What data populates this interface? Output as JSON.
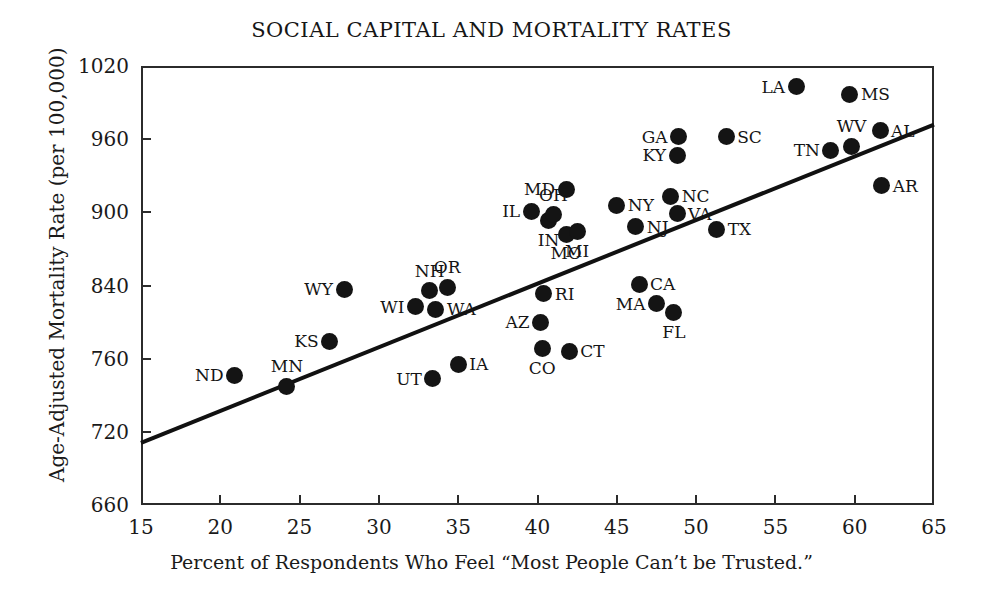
{
  "chart_data": {
    "type": "scatter",
    "title": "SOCIAL CAPITAL AND MORTALITY RATES",
    "xlabel": "Percent of Respondents Who Feel “Most People Can’t be Trusted.”",
    "ylabel": "Age-Adjusted Mortality Rate (per 100,000)",
    "xlim": [
      15,
      65
    ],
    "ylim": [
      660,
      1020
    ],
    "grid": false,
    "legend": null,
    "xticks": [
      15,
      20,
      25,
      30,
      35,
      40,
      45,
      50,
      55,
      60,
      65
    ],
    "xtick_labels": [
      "15",
      "20",
      "25",
      "30",
      "35",
      "40",
      "45",
      "50",
      "55",
      "60",
      "65"
    ],
    "yticks": [
      660,
      720,
      760,
      840,
      900,
      960,
      1020
    ],
    "ytick_labels": [
      "660",
      "720",
      "760",
      "840",
      "900",
      "960",
      "1020"
    ],
    "point_labels_field": "label",
    "trendline": {
      "type": "linear",
      "x_start": 15,
      "y_start": 711,
      "x_end": 65,
      "y_end": 972
    },
    "points": [
      {
        "label": "ND",
        "x": 20.9,
        "y": 751,
        "label_pos": "left"
      },
      {
        "label": "MN",
        "x": 24.2,
        "y": 745,
        "label_pos": "above"
      },
      {
        "label": "KS",
        "x": 26.9,
        "y": 779,
        "label_pos": "left"
      },
      {
        "label": "WY",
        "x": 27.8,
        "y": 836,
        "label_pos": "left"
      },
      {
        "label": "WI",
        "x": 32.3,
        "y": 817,
        "label_pos": "left"
      },
      {
        "label": "NH",
        "x": 33.2,
        "y": 834,
        "label_pos": "above"
      },
      {
        "label": "WA",
        "x": 33.6,
        "y": 814,
        "label_pos": "right"
      },
      {
        "label": "OR",
        "x": 34.3,
        "y": 838,
        "label_pos": "above"
      },
      {
        "label": "UT",
        "x": 33.4,
        "y": 749,
        "label_pos": "left"
      },
      {
        "label": "IA",
        "x": 35.0,
        "y": 757,
        "label_pos": "right"
      },
      {
        "label": "IL",
        "x": 39.6,
        "y": 901,
        "label_pos": "left"
      },
      {
        "label": "IN",
        "x": 40.7,
        "y": 893,
        "label_pos": "below"
      },
      {
        "label": "MD",
        "x": 41.8,
        "y": 919,
        "label_pos": "left"
      },
      {
        "label": "OH",
        "x": 41.0,
        "y": 898,
        "label_pos": "above"
      },
      {
        "label": "MO",
        "x": 41.8,
        "y": 882,
        "label_pos": "below"
      },
      {
        "label": "MI",
        "x": 42.5,
        "y": 884,
        "label_pos": "below"
      },
      {
        "label": "RI",
        "x": 40.4,
        "y": 831,
        "label_pos": "right"
      },
      {
        "label": "AZ",
        "x": 40.2,
        "y": 800,
        "label_pos": "left"
      },
      {
        "label": "CO",
        "x": 40.3,
        "y": 771,
        "label_pos": "below"
      },
      {
        "label": "CT",
        "x": 42.0,
        "y": 768,
        "label_pos": "right"
      },
      {
        "label": "NY",
        "x": 45.0,
        "y": 906,
        "label_pos": "right"
      },
      {
        "label": "NJ",
        "x": 46.2,
        "y": 888,
        "label_pos": "right"
      },
      {
        "label": "CA",
        "x": 46.4,
        "y": 841,
        "label_pos": "right"
      },
      {
        "label": "MA",
        "x": 47.5,
        "y": 820,
        "label_pos": "left"
      },
      {
        "label": "FL",
        "x": 48.6,
        "y": 810,
        "label_pos": "below"
      },
      {
        "label": "NC",
        "x": 48.4,
        "y": 913,
        "label_pos": "right"
      },
      {
        "label": "VA",
        "x": 48.8,
        "y": 899,
        "label_pos": "right"
      },
      {
        "label": "KY",
        "x": 48.8,
        "y": 947,
        "label_pos": "left"
      },
      {
        "label": "GA",
        "x": 48.9,
        "y": 962,
        "label_pos": "left"
      },
      {
        "label": "TX",
        "x": 51.3,
        "y": 886,
        "label_pos": "right"
      },
      {
        "label": "SC",
        "x": 51.9,
        "y": 962,
        "label_pos": "right"
      },
      {
        "label": "LA",
        "x": 56.3,
        "y": 1003,
        "label_pos": "left"
      },
      {
        "label": "TN",
        "x": 58.5,
        "y": 951,
        "label_pos": "left"
      },
      {
        "label": "MS",
        "x": 59.7,
        "y": 997,
        "label_pos": "right"
      },
      {
        "label": "WV",
        "x": 59.8,
        "y": 954,
        "label_pos": "above"
      },
      {
        "label": "AL",
        "x": 61.6,
        "y": 967,
        "label_pos": "right"
      },
      {
        "label": "AR",
        "x": 61.7,
        "y": 922,
        "label_pos": "right"
      }
    ]
  },
  "colors": {
    "point": "#141414",
    "line": "#111111",
    "axis": "#2b2b2b",
    "text": "#161616",
    "background": "#ffffff"
  }
}
